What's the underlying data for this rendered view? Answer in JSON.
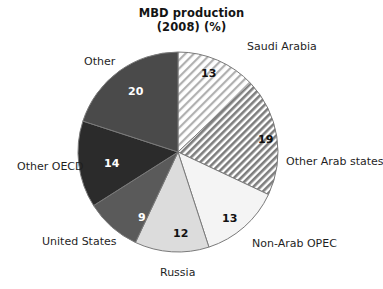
{
  "chart_data": {
    "type": "pie",
    "title": "MBD production\n(2008) (%)",
    "title_lines": [
      "MBD production",
      "(2008) (%)"
    ],
    "xlabel": "",
    "ylabel": "",
    "units": "%",
    "total": 100,
    "legend_position": "outside-labels",
    "grid": false,
    "start_angle_deg": 0,
    "direction": "clockwise",
    "categories": [
      "Saudi Arabia",
      "Other Arab states",
      "Non-Arab OPEC",
      "Russia",
      "United States",
      "Other OECD",
      "Other"
    ],
    "values": [
      13,
      19,
      13,
      12,
      9,
      14,
      20
    ],
    "slices": [
      {
        "label": "Saudi Arabia",
        "value": 13,
        "value_text": "13",
        "fill": "#ffffff",
        "pattern": "diagonal-hatch-fine",
        "pattern_color": "#a8a8a8",
        "value_color": "dark",
        "label_x": 247,
        "label_y": 40,
        "value_x": 201,
        "value_y": 68
      },
      {
        "label": "Other Arab states",
        "value": 19,
        "value_text": "19",
        "fill": "#ffffff",
        "pattern": "diagonal-hatch-bold",
        "pattern_color": "#7d7d7d",
        "value_color": "dark",
        "label_x": 286,
        "label_y": 155,
        "value_x": 258,
        "value_y": 134
      },
      {
        "label": "Non-Arab OPEC",
        "value": 13,
        "value_text": "13",
        "fill": "#f4f4f4",
        "pattern": "none",
        "pattern_color": "",
        "value_color": "dark",
        "label_x": 252,
        "label_y": 237,
        "value_x": 222,
        "value_y": 213
      },
      {
        "label": "Russia",
        "value": 12,
        "value_text": "12",
        "fill": "#dcdcdc",
        "pattern": "none",
        "pattern_color": "",
        "value_color": "dark",
        "label_x": 160,
        "label_y": 266,
        "value_x": 173,
        "value_y": 228
      },
      {
        "label": "United States",
        "value": 9,
        "value_text": "9",
        "fill": "#5a5a5a",
        "pattern": "none",
        "pattern_color": "",
        "value_color": "light",
        "label_x": 42,
        "label_y": 235,
        "value_x": 138,
        "value_y": 212
      },
      {
        "label": "Other OECD",
        "value": 14,
        "value_text": "14",
        "fill": "#2b2b2b",
        "pattern": "none",
        "pattern_color": "",
        "value_color": "light",
        "label_x": 17,
        "label_y": 160,
        "value_x": 104,
        "value_y": 158
      },
      {
        "label": "Other",
        "value": 20,
        "value_text": "20",
        "fill": "#4a4a4a",
        "pattern": "none",
        "pattern_color": "",
        "value_color": "light",
        "label_x": 84,
        "label_y": 55,
        "value_x": 128,
        "value_y": 86
      }
    ],
    "geometry": {
      "center_x": 178,
      "center_y": 152,
      "radius": 100
    },
    "colors": {
      "background": "#ffffff",
      "outline": "#7a7a7a",
      "text": "#1f1f1f",
      "title": "#141414"
    }
  }
}
